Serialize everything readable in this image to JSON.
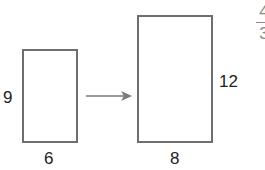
{
  "figure": {
    "original": {
      "width_label": "6",
      "height_label": "9"
    },
    "scaled": {
      "width_label": "8",
      "height_label": "12"
    },
    "arrow": "right-arrow",
    "scale_factor": {
      "numerator": "4",
      "denominator": "3"
    }
  },
  "colors": {
    "stroke": "#6e6e6e",
    "text": "#222222",
    "arrow": "#7a7a7a"
  }
}
